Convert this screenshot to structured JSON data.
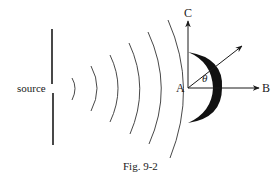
{
  "figure": {
    "caption": "Fig. 9-2",
    "labels": {
      "source": "source",
      "point_a": "A",
      "point_b": "B",
      "point_c": "C",
      "angle": "θ"
    },
    "elements": {
      "barrier": "vertical screen with slit (source)",
      "wavefronts": 6,
      "reflector": "crescent-shaped hemispherical shell centered at A",
      "arrows": [
        "A to C (vertical)",
        "A to B (horizontal)",
        "A at angle θ from AB"
      ]
    },
    "colors": {
      "ink": "#1a1a1a",
      "background": "#ffffff"
    }
  }
}
